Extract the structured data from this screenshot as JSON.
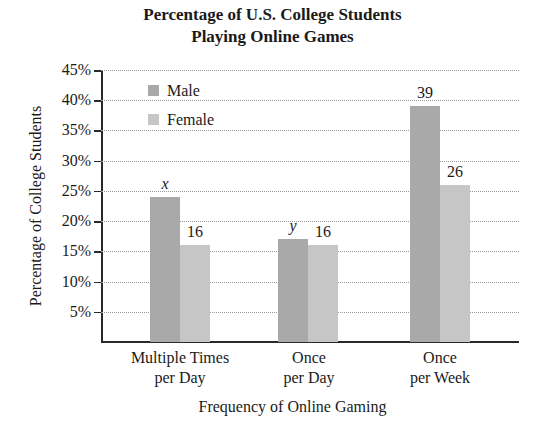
{
  "chart_data": {
    "type": "bar",
    "title": "Percentage of U.S. College Students Playing Online Games",
    "title_lines": [
      "Percentage of U.S. College Students",
      "Playing Online Games"
    ],
    "xlabel": "Frequency of Online Gaming",
    "ylabel": "Percentage of College Students",
    "ylim": [
      0,
      45
    ],
    "yticks": [
      "5%",
      "10%",
      "15%",
      "20%",
      "25%",
      "30%",
      "35%",
      "40%",
      "45%"
    ],
    "grid": true,
    "legend_position": "upper-left",
    "categories": [
      "Multiple Times per Day",
      "Once per Day",
      "Once per Week"
    ],
    "category_lines": [
      [
        "Multiple Times",
        "per Day"
      ],
      [
        "Once",
        "per Day"
      ],
      [
        "Once",
        "per Week"
      ]
    ],
    "series": [
      {
        "name": "Male",
        "color": "#a9a9a9",
        "values": [
          24,
          17,
          39
        ],
        "labels": [
          "x",
          "y",
          "39"
        ]
      },
      {
        "name": "Female",
        "color": "#c6c6c6",
        "values": [
          16,
          16,
          26
        ],
        "labels": [
          "16",
          "16",
          "26"
        ]
      }
    ],
    "annotations": [
      "Male bar for Multiple Times per Day labeled 'x' (~24%)",
      "Male bar for Once per Day labeled 'y' (~17%)"
    ]
  },
  "legend": {
    "male": "Male",
    "female": "Female"
  }
}
